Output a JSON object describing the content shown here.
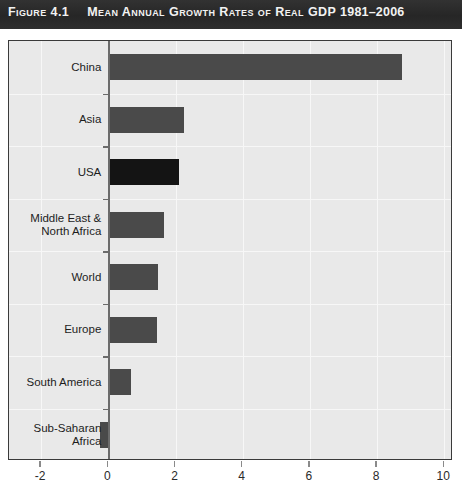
{
  "title": {
    "figure_label": "Figure",
    "figure_number": "4.1",
    "text": "Mean Annual Growth Rates of Real GDP",
    "years": "1981–2006"
  },
  "colors": {
    "title_band": "#2b2b2b",
    "title_text": "#f2f2f2",
    "plot_background": "#e9e9e9",
    "plot_border": "#3a3a3a",
    "gridline": "#f7f7f7",
    "bar": "#4a4a4a",
    "bar_highlight": "#141414",
    "axis": "#6b6b6b"
  },
  "chart_data": {
    "type": "bar",
    "orientation": "horizontal",
    "title": "Mean Annual Growth Rates of Real GDP 1981–2006",
    "xlabel": "",
    "ylabel": "",
    "categories": [
      "China",
      "Asia",
      "USA",
      "Middle East &\nNorth Africa",
      "World",
      "Europe",
      "South America",
      "Sub-Saharan\nAfrica"
    ],
    "values": [
      8.75,
      2.25,
      2.1,
      1.65,
      1.48,
      1.45,
      0.68,
      -0.25
    ],
    "highlight_index": 2,
    "xlim": [
      -2,
      10
    ],
    "xticks": [
      -2,
      0,
      2,
      4,
      6,
      8,
      10
    ],
    "xticklabels": [
      "-2",
      "0",
      "2",
      "4",
      "6",
      "8",
      "10"
    ],
    "grid": true,
    "legend": null
  }
}
